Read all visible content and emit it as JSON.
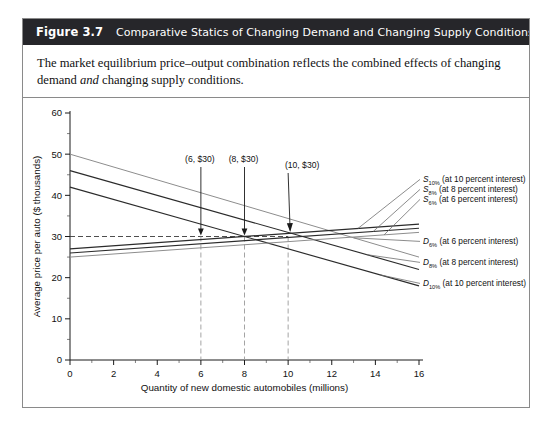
{
  "figure": {
    "number": "Figure 3.7",
    "title": "Comparative Statics of Changing Demand and Changing Supply Conditions",
    "caption_part1": "The market equilibrium price–output combination reflects the combined effects of changing demand ",
    "caption_em": "and",
    "caption_part2": " changing supply conditions."
  },
  "colors": {
    "header_bg": "#26262a",
    "header_text": "#ffffff",
    "frame": "#8a8a8a",
    "curve_dark": "#2b2b2b",
    "curve_light": "#8d8d8d",
    "guide": "#3a3a3a"
  },
  "chart_data": {
    "type": "line",
    "title": "",
    "xlabel": "Quantity of new domestic automobiles (millions)",
    "ylabel": "Average price per auto ($ thousands)",
    "xlim": [
      0,
      16
    ],
    "ylim": [
      0,
      60
    ],
    "xticks": [
      0,
      2,
      4,
      6,
      8,
      10,
      12,
      14,
      16
    ],
    "yticks": [
      0,
      10,
      20,
      30,
      40,
      50,
      60
    ],
    "xtick_labels": [
      "0",
      "2",
      "4",
      "6",
      "8",
      "10",
      "12",
      "14",
      "16"
    ],
    "ytick_labels": [
      "0",
      "10",
      "20",
      "30",
      "40",
      "50",
      "60"
    ],
    "grid": false,
    "legend_position": "right-inline",
    "series": [
      {
        "name": "D_6%",
        "label_main": "D",
        "label_sub": "6%",
        "label_rest": "(at 6 percent interest)",
        "x": [
          0,
          16
        ],
        "y": [
          50,
          25
        ],
        "style": "light"
      },
      {
        "name": "D_8%",
        "label_main": "D",
        "label_sub": "8%",
        "label_rest": "(at 8 percent interest)",
        "x": [
          0,
          16
        ],
        "y": [
          46,
          22
        ],
        "style": "dark"
      },
      {
        "name": "D_10%",
        "label_main": "D",
        "label_sub": "10%",
        "label_rest": "(at 10 percent interest)",
        "x": [
          0,
          16
        ],
        "y": [
          42,
          18
        ],
        "style": "dark"
      },
      {
        "name": "S_10%",
        "label_main": "S",
        "label_sub": "10%",
        "label_rest": "(at 10 percent interest)",
        "x": [
          0,
          16
        ],
        "y": [
          27,
          33
        ],
        "style": "dark"
      },
      {
        "name": "S_8%",
        "label_main": "S",
        "label_sub": "8%",
        "label_rest": "(at 8 percent interest)",
        "x": [
          0,
          16
        ],
        "y": [
          26,
          32
        ],
        "style": "dark"
      },
      {
        "name": "S_6%",
        "label_main": "S",
        "label_sub": "6%",
        "label_rest": "(at 6 percent interest)",
        "x": [
          0,
          16
        ],
        "y": [
          25,
          31
        ],
        "style": "light"
      }
    ],
    "equilibrium_price": 30,
    "annotations": [
      {
        "label": "(6, $30)",
        "x": 6,
        "y": 30
      },
      {
        "label": "(8, $30)",
        "x": 8,
        "y": 30
      },
      {
        "label": "(10, $30)",
        "x": 10,
        "y": 30
      }
    ]
  }
}
